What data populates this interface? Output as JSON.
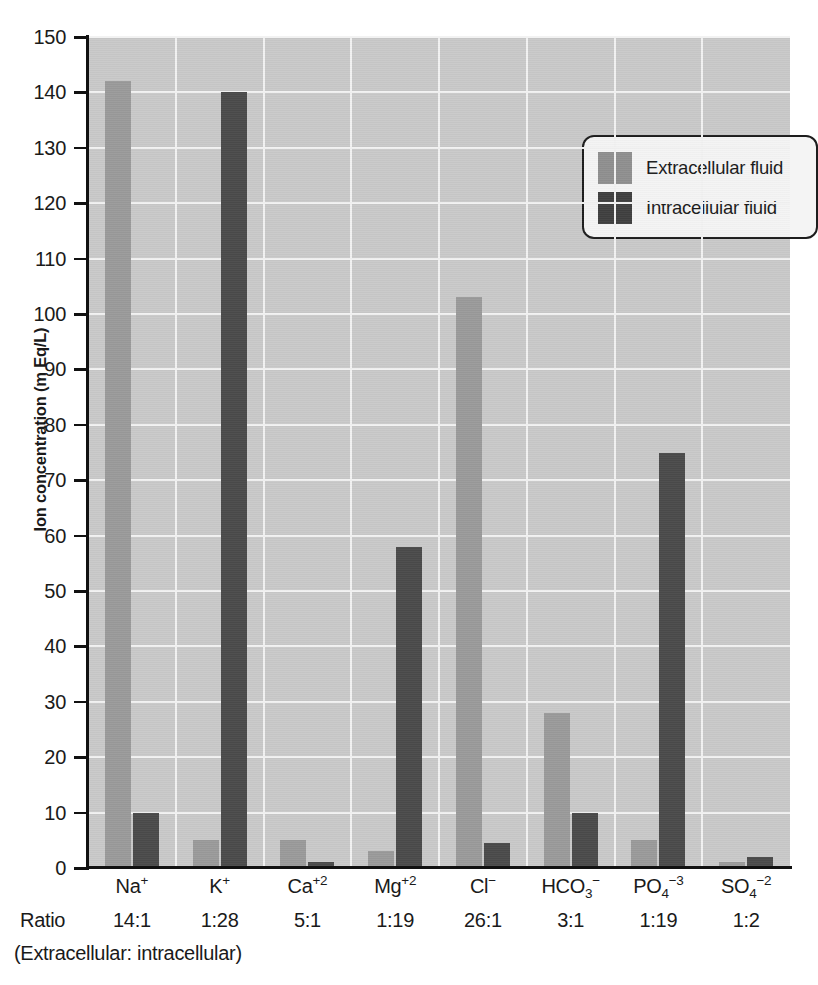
{
  "chart_data": {
    "type": "bar",
    "title": "",
    "xlabel": "",
    "ylabel": "Ion concentration (m Eq/L)",
    "ylim": [
      0,
      150
    ],
    "ytick_step": 10,
    "yticks": [
      0,
      10,
      20,
      30,
      40,
      50,
      60,
      70,
      80,
      90,
      100,
      110,
      120,
      130,
      140,
      150
    ],
    "grid": true,
    "legend_position": "upper-right-inside",
    "categories": [
      {
        "base": "Na",
        "sup": "+",
        "sub": "",
        "ratio": "14:1"
      },
      {
        "base": "K",
        "sup": "+",
        "sub": "",
        "ratio": "1:28"
      },
      {
        "base": "Ca",
        "sup": "+2",
        "sub": "",
        "ratio": "5:1"
      },
      {
        "base": "Mg",
        "sup": "+2",
        "sub": "",
        "ratio": "1:19"
      },
      {
        "base": "Cl",
        "sup": "−",
        "sub": "",
        "ratio": "26:1"
      },
      {
        "base": "HCO",
        "sup": "−",
        "sub": "3",
        "ratio": "3:1"
      },
      {
        "base": "PO",
        "sup": "−3",
        "sub": "4",
        "ratio": "1:19"
      },
      {
        "base": "SO",
        "sup": "−2",
        "sub": "4",
        "ratio": "1:2"
      }
    ],
    "category_labels": [
      "Na+",
      "K+",
      "Ca+2",
      "Mg+2",
      "Cl−",
      "HCO3−",
      "PO4−3",
      "SO4−2"
    ],
    "ratios": [
      "14:1",
      "1:28",
      "5:1",
      "1:19",
      "26:1",
      "3:1",
      "1:19",
      "1:2"
    ],
    "series": [
      {
        "name": "Extracellular fluid",
        "color": "#9a9a9a",
        "values": [
          142,
          5,
          5,
          3,
          103,
          28,
          5,
          1
        ]
      },
      {
        "name": "Intracellular fluid",
        "color": "#4a4a4a",
        "values": [
          10,
          140,
          1,
          58,
          4.5,
          10,
          75,
          2
        ]
      }
    ]
  },
  "labels": {
    "ratio_word": "Ratio",
    "ratio_caption": "(Extracellular: intracellular)"
  },
  "legend": {
    "items": [
      {
        "label": "Extracellular fluid",
        "swatch": "ecf"
      },
      {
        "label": "Intracellular fluid",
        "swatch": "icf"
      }
    ]
  },
  "colors": {
    "plot_background": "#c9c9c9",
    "gridline": "#f2f2f2",
    "axis": "#111111",
    "extracellular": "#9a9a9a",
    "intracellular": "#4a4a4a",
    "legend_background": "#f4f4f4",
    "legend_border": "#1d1d1d"
  }
}
